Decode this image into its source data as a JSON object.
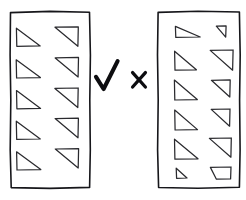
{
  "figure": {
    "background_color": "#ffffff",
    "ink_color": "#2a2a2e",
    "frame_color": "#16161a",
    "mark_color": "#0d0d10"
  },
  "panels": [
    {
      "id": "left-panel",
      "role": "good-example",
      "verdict": "check",
      "verdict_glyph": "✓",
      "rows": 5,
      "columns": 2,
      "shape_count": 10,
      "consistency": "uniform",
      "frame": {
        "x": 10,
        "y": 11,
        "width": 80,
        "height": 177
      },
      "shapes": [
        {
          "row": 1,
          "col": 1,
          "kind": "right-triangle",
          "orientation": "right-angle-bottom-left",
          "x": 16,
          "y": 28,
          "w": 24,
          "h": 18
        },
        {
          "row": 1,
          "col": 2,
          "kind": "right-triangle",
          "orientation": "right-angle-top-right",
          "x": 55,
          "y": 27,
          "w": 23,
          "h": 19
        },
        {
          "row": 2,
          "col": 1,
          "kind": "right-triangle",
          "orientation": "right-angle-bottom-left",
          "x": 16,
          "y": 60,
          "w": 24,
          "h": 18
        },
        {
          "row": 2,
          "col": 2,
          "kind": "right-triangle",
          "orientation": "right-angle-top-right",
          "x": 55,
          "y": 58,
          "w": 23,
          "h": 19
        },
        {
          "row": 3,
          "col": 1,
          "kind": "right-triangle",
          "orientation": "right-angle-bottom-left",
          "x": 16,
          "y": 91,
          "w": 24,
          "h": 18
        },
        {
          "row": 3,
          "col": 2,
          "kind": "right-triangle",
          "orientation": "right-angle-top-right",
          "x": 55,
          "y": 88,
          "w": 23,
          "h": 19
        },
        {
          "row": 4,
          "col": 1,
          "kind": "right-triangle",
          "orientation": "right-angle-bottom-left",
          "x": 16,
          "y": 121,
          "w": 24,
          "h": 18
        },
        {
          "row": 4,
          "col": 2,
          "kind": "right-triangle",
          "orientation": "right-angle-top-right",
          "x": 55,
          "y": 118,
          "w": 23,
          "h": 19
        },
        {
          "row": 5,
          "col": 1,
          "kind": "right-triangle",
          "orientation": "right-angle-bottom-left",
          "x": 16,
          "y": 152,
          "w": 24,
          "h": 18
        },
        {
          "row": 5,
          "col": 2,
          "kind": "right-triangle",
          "orientation": "right-angle-top-right",
          "x": 55,
          "y": 149,
          "w": 23,
          "h": 19
        }
      ]
    },
    {
      "id": "right-panel",
      "role": "bad-example",
      "verdict": "cross",
      "verdict_glyph": "×",
      "rows": 6,
      "columns": 2,
      "shape_count": 12,
      "consistency": "irregular",
      "frame": {
        "x": 157,
        "y": 11,
        "width": 83,
        "height": 177
      },
      "shapes": [
        {
          "row": 1,
          "col": 1,
          "kind": "right-triangle",
          "orientation": "right-angle-bottom-left",
          "variant": "wide-flat",
          "x": 175,
          "y": 26,
          "w": 25,
          "h": 11
        },
        {
          "row": 1,
          "col": 2,
          "kind": "right-triangle",
          "orientation": "right-angle-top-right",
          "variant": "tiny",
          "x": 216,
          "y": 26,
          "w": 10,
          "h": 11
        },
        {
          "row": 2,
          "col": 1,
          "kind": "right-triangle",
          "orientation": "right-angle-bottom-left",
          "variant": "normal",
          "x": 174,
          "y": 51,
          "w": 22,
          "h": 19
        },
        {
          "row": 2,
          "col": 2,
          "kind": "right-triangle",
          "orientation": "right-angle-top-right",
          "variant": "normal",
          "x": 210,
          "y": 50,
          "w": 23,
          "h": 20
        },
        {
          "row": 3,
          "col": 1,
          "kind": "right-triangle",
          "orientation": "right-angle-bottom-left",
          "variant": "normal",
          "x": 174,
          "y": 80,
          "w": 23,
          "h": 20
        },
        {
          "row": 3,
          "col": 2,
          "kind": "right-triangle",
          "orientation": "right-angle-top-right",
          "variant": "small",
          "x": 211,
          "y": 80,
          "w": 19,
          "h": 17
        },
        {
          "row": 4,
          "col": 1,
          "kind": "right-triangle",
          "orientation": "right-angle-bottom-left",
          "variant": "normal",
          "x": 174,
          "y": 110,
          "w": 23,
          "h": 20
        },
        {
          "row": 4,
          "col": 2,
          "kind": "right-triangle",
          "orientation": "right-angle-top-right",
          "variant": "small",
          "x": 211,
          "y": 109,
          "w": 19,
          "h": 17
        },
        {
          "row": 5,
          "col": 1,
          "kind": "right-triangle",
          "orientation": "right-angle-bottom-left",
          "variant": "normal",
          "x": 174,
          "y": 139,
          "w": 24,
          "h": 20
        },
        {
          "row": 5,
          "col": 2,
          "kind": "right-triangle",
          "orientation": "right-angle-top-right",
          "variant": "normal",
          "x": 209,
          "y": 138,
          "w": 22,
          "h": 19
        },
        {
          "row": 6,
          "col": 1,
          "kind": "right-triangle",
          "orientation": "right-angle-bottom-left",
          "variant": "tiny",
          "x": 176,
          "y": 168,
          "w": 11,
          "h": 10
        },
        {
          "row": 6,
          "col": 2,
          "kind": "trapezoid",
          "orientation": "truncated-triangle",
          "variant": "clipped-apex",
          "x": 210,
          "y": 167,
          "w": 21,
          "h": 12
        }
      ]
    }
  ],
  "marks": [
    {
      "id": "check-mark",
      "symbol": "check",
      "glyph": "✓",
      "meaning": "correct",
      "applies_to": "left-panel",
      "x": 95,
      "y": 60,
      "width": 24,
      "height": 31
    },
    {
      "id": "cross-mark",
      "symbol": "cross",
      "glyph": "×",
      "meaning": "incorrect",
      "applies_to": "right-panel",
      "x": 131,
      "y": 71,
      "width": 16,
      "height": 17
    }
  ]
}
